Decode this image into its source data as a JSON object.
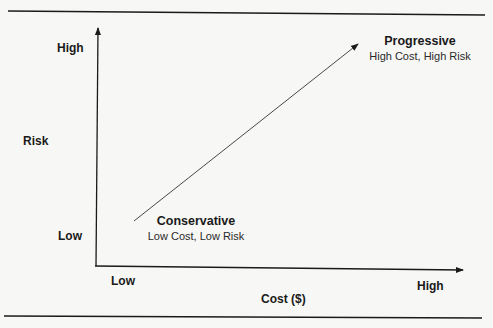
{
  "diagram": {
    "y_axis": {
      "label": "Risk",
      "high_label": "High",
      "low_label": "Low"
    },
    "x_axis": {
      "label": "Cost ($)",
      "low_label": "Low",
      "high_label": "High"
    },
    "start_node": {
      "title": "Conservative",
      "subtitle": "Low Cost, Low Risk"
    },
    "end_node": {
      "title": "Progressive",
      "subtitle": "High Cost, High Risk"
    },
    "colors": {
      "line": "#1a1a1a",
      "background": "#f7f7f5"
    }
  }
}
